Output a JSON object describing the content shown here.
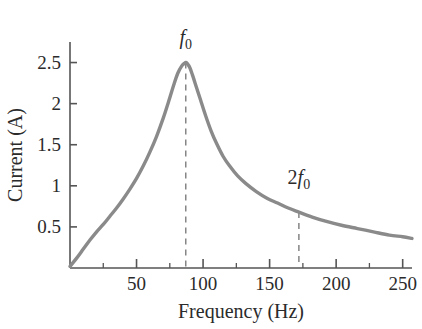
{
  "chart_data": {
    "type": "line",
    "title": "",
    "xlabel": "Frequency (Hz)",
    "ylabel": "Current (A)",
    "xlim": [
      0,
      257
    ],
    "ylim": [
      0,
      2.75
    ],
    "grid": false,
    "legend_position": "none",
    "x_ticks": [
      50,
      100,
      150,
      200,
      250
    ],
    "x_tick_labels": [
      "50",
      "100",
      "150",
      "200",
      "250"
    ],
    "x_minor_ticks": [
      25,
      75,
      125,
      175,
      225
    ],
    "y_ticks": [
      0.5,
      1,
      1.5,
      2,
      2.5
    ],
    "y_tick_labels": [
      "0.5",
      "1",
      "1.5",
      "2",
      "2.5"
    ],
    "series": [
      {
        "name": "Current vs Frequency",
        "color": "#8a8a8a",
        "x": [
          0,
          5,
          10,
          15,
          20,
          25,
          30,
          35,
          40,
          45,
          50,
          55,
          60,
          65,
          70,
          74,
          78,
          81,
          84,
          86,
          87,
          88,
          90,
          92,
          95,
          98,
          102,
          106,
          110,
          115,
          120,
          126,
          132,
          140,
          148,
          156,
          164,
          172,
          182,
          192,
          204,
          216,
          228,
          240,
          250,
          257
        ],
        "y": [
          0.02,
          0.12,
          0.23,
          0.34,
          0.44,
          0.53,
          0.63,
          0.73,
          0.84,
          0.96,
          1.09,
          1.24,
          1.41,
          1.6,
          1.82,
          2.02,
          2.23,
          2.37,
          2.46,
          2.49,
          2.5,
          2.49,
          2.44,
          2.35,
          2.2,
          2.05,
          1.85,
          1.67,
          1.52,
          1.36,
          1.24,
          1.12,
          1.03,
          0.93,
          0.85,
          0.79,
          0.73,
          0.68,
          0.62,
          0.57,
          0.52,
          0.48,
          0.44,
          0.4,
          0.38,
          0.36
        ]
      }
    ],
    "annotations": [
      {
        "id": "f0",
        "prefix": "",
        "symbol": "f",
        "subscript": "0",
        "x_value": 87,
        "y_value": 2.5,
        "label_y_value": 2.72,
        "marker": "dashed-vertical-line"
      },
      {
        "id": "2f0",
        "prefix": "2",
        "symbol": "f",
        "subscript": "0",
        "x_value": 172,
        "y_value": 0.68,
        "label_y_value": 1.02,
        "marker": "dashed-vertical-line"
      }
    ],
    "axis_color": "#555555",
    "curve_color": "#8a8a8a",
    "dash_color": "#7d7d7d",
    "text_color": "#2b2b2b"
  }
}
